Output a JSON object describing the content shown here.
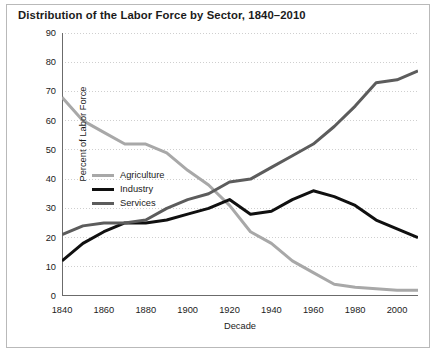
{
  "chart_data": {
    "type": "line",
    "title": "Distribution of the Labor Force by Sector, 1840–2010",
    "xlabel": "Decade",
    "ylabel": "Percent of Labor Force",
    "xlim": [
      1840,
      2010
    ],
    "ylim": [
      0,
      90
    ],
    "grid": true,
    "grid_axis": "y",
    "legend_position": "inside-left",
    "x_tick_labels": [
      "1840",
      "1860",
      "1880",
      "1900",
      "1920",
      "1940",
      "1960",
      "1980",
      "2000"
    ],
    "x_tick_values": [
      1840,
      1860,
      1880,
      1900,
      1920,
      1940,
      1960,
      1980,
      2000
    ],
    "x_minor_tick_values": [
      1850,
      1870,
      1890,
      1910,
      1930,
      1950,
      1970,
      1990,
      2010
    ],
    "y_tick_labels": [
      "0",
      "10",
      "20",
      "30",
      "40",
      "50",
      "60",
      "70",
      "80",
      "90"
    ],
    "y_tick_values": [
      0,
      10,
      20,
      30,
      40,
      50,
      60,
      70,
      80,
      90
    ],
    "x": [
      1840,
      1850,
      1860,
      1870,
      1880,
      1890,
      1900,
      1910,
      1920,
      1930,
      1940,
      1950,
      1960,
      1970,
      1980,
      1990,
      2000,
      2010
    ],
    "series": [
      {
        "name": "Agriculture",
        "color": "#a8a8a8",
        "width": 3.0,
        "values": [
          68,
          60,
          56,
          52,
          52,
          49,
          43,
          38,
          31,
          22,
          18,
          12,
          8,
          4,
          3,
          2.5,
          2,
          2
        ]
      },
      {
        "name": "Industry",
        "color": "#101010",
        "width": 3.0,
        "values": [
          12,
          18,
          22,
          25,
          25,
          26,
          28,
          30,
          33,
          28,
          29,
          33,
          36,
          34,
          31,
          26,
          23,
          20
        ]
      },
      {
        "name": "Services",
        "color": "#5c5c5c",
        "width": 3.0,
        "values": [
          21,
          24,
          25,
          25,
          26,
          30,
          33,
          35,
          39,
          40,
          44,
          48,
          52,
          58,
          65,
          73,
          74,
          77
        ]
      }
    ]
  },
  "colors": {
    "background": "#ffffff",
    "text": "#1b1b1b",
    "axis": "#6b6b6b",
    "grid": "#cfcfcf",
    "frame": "#b9b9b9"
  }
}
